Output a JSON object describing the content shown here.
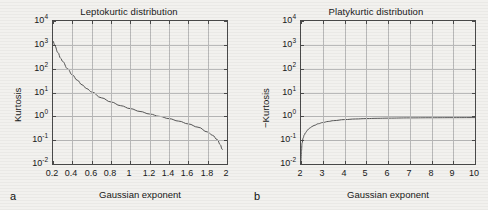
{
  "figure": {
    "background_color": "#f2f1ee",
    "axis_color": "#4a4a4a",
    "grid_color": "#b9b9b9",
    "curve_color": "#555555"
  },
  "panels": [
    {
      "label": "a",
      "title": "Leptokurtic distribution",
      "xlabel": "Gaussian exponent",
      "ylabel": "Kurtosis",
      "ytick_labels": [
        "10",
        "10",
        "10",
        "10",
        "10",
        "10",
        "10"
      ],
      "ytick_exponents": [
        "4",
        "3",
        "2",
        "1",
        "0",
        "-1",
        "-2"
      ],
      "xtick_labels": [
        "0.2",
        "0.4",
        "0.6",
        "0.8",
        "1",
        "1.2",
        "1.4",
        "1.6",
        "1.8",
        "2"
      ]
    },
    {
      "label": "b",
      "title": "Platykurtic distribution",
      "xlabel": "Gaussian exponent",
      "ylabel": "−Kurtosis",
      "ytick_labels": [
        "10",
        "10",
        "10",
        "10",
        "10",
        "10",
        "10"
      ],
      "ytick_exponents": [
        "4",
        "3",
        "2",
        "1",
        "0",
        "-1",
        "-2"
      ],
      "xtick_labels": [
        "2",
        "3",
        "4",
        "5",
        "6",
        "7",
        "8",
        "9",
        "10"
      ]
    }
  ],
  "chart_data": [
    {
      "type": "line",
      "title": "Leptokurtic distribution",
      "xlabel": "Gaussian exponent",
      "ylabel": "Kurtosis",
      "yscale": "log",
      "xlim": [
        0.2,
        2.0
      ],
      "ylim": [
        0.01,
        10000
      ],
      "grid": true,
      "legend": "none",
      "x": [
        0.2,
        0.22,
        0.25,
        0.28,
        0.3,
        0.35,
        0.4,
        0.45,
        0.5,
        0.55,
        0.6,
        0.7,
        0.8,
        0.9,
        1.0,
        1.1,
        1.2,
        1.3,
        1.4,
        1.5,
        1.6,
        1.7,
        1.8,
        1.85,
        1.9,
        1.93,
        1.95
      ],
      "y": [
        1500,
        900,
        480,
        270,
        200,
        100,
        55,
        33,
        21,
        14.5,
        10.5,
        6.0,
        4.0,
        2.8,
        2.1,
        1.6,
        1.25,
        1.0,
        0.8,
        0.63,
        0.48,
        0.35,
        0.22,
        0.16,
        0.105,
        0.065,
        0.04
      ]
    },
    {
      "type": "line",
      "title": "Platykurtic distribution",
      "xlabel": "Gaussian exponent",
      "ylabel": "−Kurtosis",
      "yscale": "log",
      "xlim": [
        2,
        10
      ],
      "ylim": [
        0.01,
        10000
      ],
      "grid": true,
      "legend": "none",
      "x": [
        2.0,
        2.02,
        2.05,
        2.1,
        2.15,
        2.2,
        2.3,
        2.4,
        2.5,
        2.6,
        2.8,
        3.0,
        3.25,
        3.5,
        4.0,
        4.5,
        5.0,
        5.5,
        6.0,
        7.0,
        8.0,
        9.0,
        10.0
      ],
      "y": [
        0.012,
        0.035,
        0.075,
        0.125,
        0.165,
        0.2,
        0.265,
        0.32,
        0.37,
        0.415,
        0.49,
        0.55,
        0.61,
        0.66,
        0.73,
        0.775,
        0.805,
        0.825,
        0.84,
        0.86,
        0.872,
        0.88,
        0.885
      ]
    }
  ]
}
